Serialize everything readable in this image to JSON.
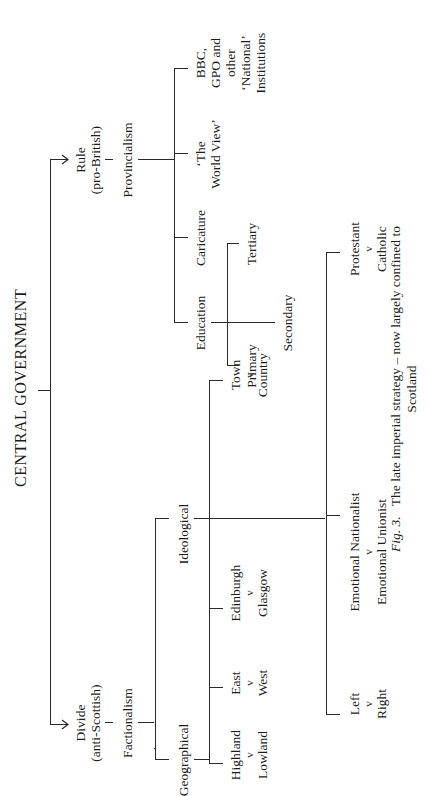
{
  "diagram": {
    "root": "CENTRAL GOVERNMENT",
    "branches": {
      "divide": {
        "label_line1": "Divide",
        "label_line2": "(anti-Scottish)",
        "child": "Factionalism",
        "categories": {
          "geographical": {
            "label": "Geographical",
            "pairs": [
              {
                "a": "Highland",
                "v": "v",
                "b": "Lowland"
              },
              {
                "a": "East",
                "v": "v",
                "b": "West"
              },
              {
                "a": "Edinburgh",
                "v": "v",
                "b": "Glasgow"
              },
              {
                "a": "Town",
                "v": "v",
                "b": "Country"
              }
            ]
          },
          "ideological": {
            "label": "Ideological",
            "pairs": [
              {
                "a": "Left",
                "v": "v",
                "b": "Right"
              },
              {
                "a": "Emotional Nationalist",
                "v": "v",
                "b": "Emotional Unionist"
              },
              {
                "a": "Protestant",
                "v": "v",
                "b": "Catholic"
              }
            ]
          }
        }
      },
      "rule": {
        "label_line1": "Rule",
        "label_line2": "(pro-British)",
        "child": "Provincialism",
        "items": {
          "education": {
            "label": "Education",
            "children": [
              "Primary",
              "Secondary",
              "Tertiary"
            ]
          },
          "caricature": "Caricature",
          "world_view_line1": "‘The",
          "world_view_line2": "World View’",
          "institutions_lines": [
            "BBC,",
            "GPO and",
            "other",
            "‘National’",
            "Institutions"
          ]
        }
      }
    },
    "caption": {
      "fig": "Fig. 3.",
      "line1": "The late imperial strategy – now largely confined to",
      "line2": "Scotland"
    }
  }
}
